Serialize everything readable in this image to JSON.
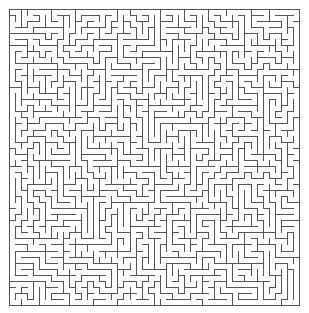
{
  "page": {
    "width": 309,
    "height": 313,
    "background_color": "#ffffff"
  },
  "maze": {
    "label": "maze",
    "type": "perfect-maze",
    "algorithm": "randomized-depth-first-search",
    "seed": 20240717,
    "columns": 48,
    "rows": 49,
    "cell_size": 6.05,
    "origin_x": 9,
    "origin_y": 9,
    "grid_width": 290.4,
    "grid_height": 296.45,
    "wall_color": "#555555",
    "wall_thickness": 1,
    "border_color": "#555555",
    "border_thickness": 1,
    "entrance": "none",
    "exit": "none",
    "borders_closed": true
  }
}
